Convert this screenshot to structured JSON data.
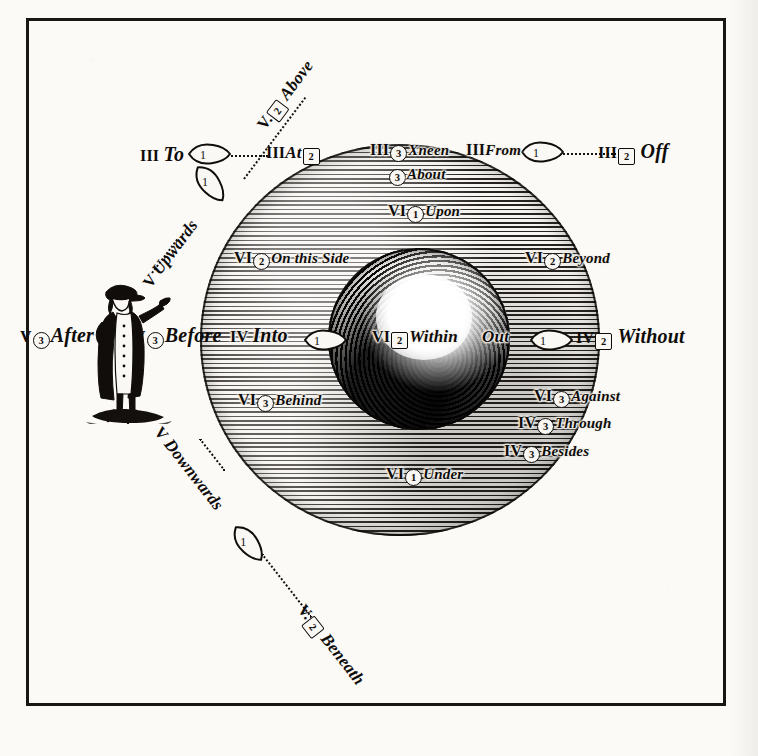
{
  "plate": {
    "title": "Diagram of Prepositions",
    "ink_color": "#0e0c0a",
    "paper_color": "#fbfaf7"
  },
  "labels": {
    "to": {
      "roman": "III",
      "num": "1",
      "shape": "circle",
      "word": "To"
    },
    "at": {
      "roman": "III",
      "num": "2",
      "shape": "square",
      "word": "At"
    },
    "off": {
      "roman": "III",
      "num": "2",
      "shape": "square",
      "word": "Off"
    },
    "from": {
      "roman": "III",
      "num": "",
      "shape": "none",
      "word": "From"
    },
    "xneen": {
      "roman": "III",
      "num": "3",
      "shape": "circle",
      "word": "Xneen"
    },
    "above": {
      "roman": "V.",
      "num": "2",
      "shape": "square",
      "word": "Above"
    },
    "upwards": {
      "roman": "V",
      "num": "1",
      "shape": "circle",
      "word": "Upwards"
    },
    "downwards": {
      "roman": "V",
      "num": "1",
      "shape": "circle",
      "word": "Downwards"
    },
    "beneath": {
      "roman": "V.",
      "num": "2",
      "shape": "square",
      "word": "Beneath"
    },
    "after": {
      "roman": "V",
      "num": "3",
      "shape": "circle",
      "word": "After"
    },
    "before": {
      "roman": "V",
      "num": "3",
      "shape": "circle",
      "word": "Before"
    },
    "about": {
      "roman": "",
      "num": "3",
      "shape": "circle",
      "word": "About"
    },
    "upon": {
      "roman": "VI",
      "num": "1",
      "shape": "circle",
      "word": "Upon"
    },
    "on_this_side": {
      "roman": "VI",
      "num": "2",
      "shape": "circle",
      "word": "On this Side"
    },
    "beyond": {
      "roman": "VI",
      "num": "2",
      "shape": "circle",
      "word": "Beyond"
    },
    "into": {
      "roman": "IV",
      "num": "",
      "shape": "none",
      "word": "Into"
    },
    "within": {
      "roman": "VI",
      "num": "2",
      "shape": "square",
      "word": "Within"
    },
    "out": {
      "roman": "",
      "num": "",
      "shape": "none",
      "word": "Out"
    },
    "without": {
      "roman": "IV",
      "num": "2",
      "shape": "square",
      "word": "Without"
    },
    "behind": {
      "roman": "VI",
      "num": "3",
      "shape": "circle",
      "word": "Behind"
    },
    "against": {
      "roman": "VI",
      "num": "3",
      "shape": "circle",
      "word": "Against"
    },
    "through": {
      "roman": "IV",
      "num": "3",
      "shape": "circle",
      "word": "Through"
    },
    "besides": {
      "roman": "IV",
      "num": "3",
      "shape": "circle",
      "word": "Besides"
    },
    "under": {
      "roman": "VI",
      "num": "1",
      "shape": "circle",
      "word": "Under"
    }
  },
  "arrows": {
    "to_arrow": {
      "num": "1",
      "direction": "right"
    },
    "upwards_arrow": {
      "num": "1",
      "direction": "up-right"
    },
    "downwards_arrow": {
      "num": "1",
      "direction": "down-left"
    },
    "from_arrow": {
      "num": "1",
      "direction": "right"
    },
    "into_arrow": {
      "num": "1",
      "direction": "right"
    },
    "out_arrow": {
      "num": "1",
      "direction": "right"
    }
  },
  "figure": {
    "man": "standing-man-pointing"
  }
}
